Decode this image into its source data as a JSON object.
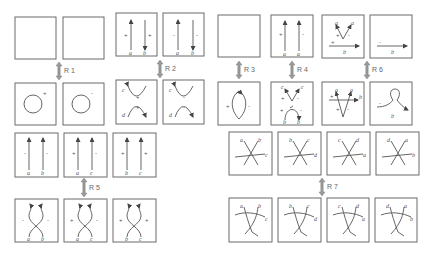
{
  "moves": {
    "R1": "R 1",
    "R2": "R 2",
    "R3": "R 3",
    "R4": "R 4",
    "R5": "R 5",
    "R6": "R 6",
    "R7": "R 7"
  },
  "signs": {
    "plus": "+",
    "minus": "-"
  },
  "labels": {
    "a": "a",
    "b": "b",
    "c": "c",
    "d": "d"
  },
  "r7_top_labels": [
    [
      "a",
      "b",
      "c"
    ],
    [
      "b",
      "c",
      "d"
    ],
    [
      "c",
      "d",
      "a"
    ],
    [
      "d",
      "a",
      "b"
    ]
  ],
  "r7_bottom_labels": [
    [
      "a",
      "b",
      "c"
    ],
    [
      "b",
      "c",
      "d"
    ],
    [
      "c",
      "d",
      "a"
    ],
    [
      "d",
      "a",
      "b"
    ]
  ],
  "r5_top_labels": [
    [
      "a",
      "b"
    ],
    [
      "a",
      "c"
    ],
    [
      "b",
      "c"
    ]
  ],
  "r5_top_signs": [
    [
      "-",
      "-"
    ],
    [
      "+",
      "-"
    ],
    [
      "+",
      "+"
    ]
  ],
  "r5_bottom_labels": [
    [
      "a",
      "b"
    ],
    [
      "a",
      "c"
    ],
    [
      "b",
      "c"
    ]
  ],
  "r5_bottom_signs": [
    [
      "-",
      "-"
    ],
    [
      "+",
      "-"
    ],
    [
      "+",
      "+"
    ]
  ],
  "colors": {
    "line": "#555555",
    "box": "#6a6a6a",
    "arrow": "#999999"
  }
}
